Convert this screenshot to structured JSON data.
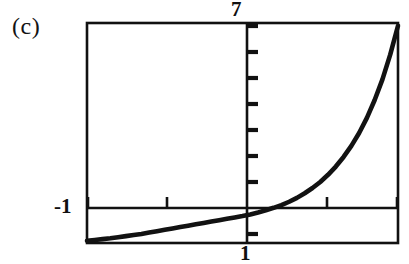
{
  "figure": {
    "panel_label": "(c)",
    "background_color": "#ffffff",
    "ink_color": "#111111"
  },
  "labels": {
    "y_max": "7",
    "y_min": "-1",
    "x_max": "1"
  },
  "chart_data": {
    "type": "line",
    "title": "(c)",
    "xlabel": "",
    "ylabel": "",
    "grid": false,
    "legend": null,
    "xlim": [
      -1,
      1
    ],
    "ylim": [
      -1,
      7
    ],
    "axis_style": "calculator-window",
    "x_axis_value": 0,
    "y_axis_value": 0,
    "y_tick_count": 8,
    "y_tick_values": [
      -1,
      0,
      1,
      2,
      3,
      4,
      5,
      6,
      7
    ],
    "x_tick_values": [
      -1,
      -0.5,
      0,
      0.5,
      1
    ],
    "tick_label_positions": {
      "y_max": "above-frame-at-y-axis",
      "y_min": "left-of-frame-at-x-axis",
      "x_max": "below-frame-at-y-axis"
    },
    "series": [
      {
        "name": "exponential-growth-curve",
        "description": "Curve rising slowly from just below the x-axis on the left, flattening near y=0 through the middle, then increasing steeply to the top-right corner.",
        "x": [
          -1.0,
          -0.95,
          -0.9,
          -0.85,
          -0.8,
          -0.75,
          -0.7,
          -0.65,
          -0.6,
          -0.55,
          -0.5,
          -0.45,
          -0.4,
          -0.35,
          -0.3,
          -0.25,
          -0.2,
          -0.15,
          -0.1,
          -0.05,
          0.0,
          0.05,
          0.1,
          0.15,
          0.2,
          0.25,
          0.3,
          0.35,
          0.4,
          0.45,
          0.5,
          0.55,
          0.6,
          0.65,
          0.7,
          0.75,
          0.8,
          0.85,
          0.9,
          0.95,
          1.0
        ],
        "y": [
          -0.92,
          -0.89,
          -0.86,
          -0.83,
          -0.79,
          -0.75,
          -0.71,
          -0.67,
          -0.62,
          -0.57,
          -0.52,
          -0.47,
          -0.42,
          -0.37,
          -0.32,
          -0.27,
          -0.22,
          -0.17,
          -0.12,
          -0.07,
          -0.02,
          0.04,
          0.11,
          0.19,
          0.28,
          0.38,
          0.5,
          0.64,
          0.81,
          1.0,
          1.22,
          1.48,
          1.78,
          2.13,
          2.53,
          3.0,
          3.55,
          4.2,
          4.95,
          5.85,
          6.9
        ]
      }
    ]
  }
}
